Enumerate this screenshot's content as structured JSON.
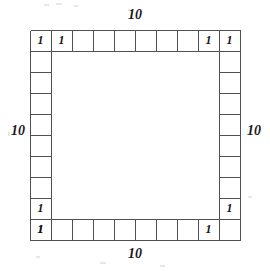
{
  "figure": {
    "type": "geometry-diagram",
    "grid": {
      "side_cells": 10,
      "cell_size_units": 1,
      "interior_filled": false
    },
    "dimension_labels": {
      "top": "10",
      "right": "10",
      "bottom": "10",
      "left": "10"
    },
    "cell_labels": {
      "unit_value": "1",
      "top_row": [
        "1",
        "1",
        "",
        "",
        "",
        "",
        "",
        "",
        "1",
        "1"
      ],
      "right_column": [
        "1",
        "",
        "",
        "",
        "",
        "",
        "",
        "",
        "1",
        ""
      ],
      "bottom_row": [
        "1",
        "",
        "",
        "",
        "",
        "",
        "",
        "",
        "1",
        ""
      ],
      "left_column": [
        "1",
        "",
        "",
        "",
        "",
        "",
        "",
        "",
        "1",
        "1"
      ]
    },
    "colors": {
      "stroke": "#4f4f55",
      "text": "#16161a",
      "background": "#ffffff"
    }
  }
}
